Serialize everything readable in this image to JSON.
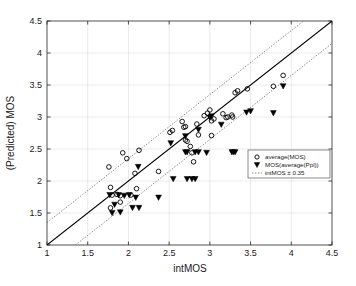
{
  "chart_data": {
    "type": "scatter",
    "title": "",
    "xlabel": "intMOS",
    "ylabel": "(Predicted) MOS",
    "xlim": [
      1,
      4.5
    ],
    "ylim": [
      1,
      4.5
    ],
    "xticks": [
      "1",
      "1.5",
      "2",
      "2.5",
      "3",
      "3.5",
      "4",
      "4.5"
    ],
    "xtick_values": [
      1,
      1.5,
      2,
      2.5,
      3,
      3.5,
      4,
      4.5
    ],
    "yticks": [
      "1",
      "1.5",
      "2",
      "2.5",
      "3",
      "3.5",
      "4",
      "4.5"
    ],
    "ytick_values": [
      1,
      1.5,
      2,
      2.5,
      3,
      3.5,
      4,
      4.5
    ],
    "grid": true,
    "legend_position": "lower-right",
    "reference_lines": [
      {
        "name": "identity",
        "style": "solid",
        "slope": 1,
        "intercept": 0
      },
      {
        "name": "upper-band",
        "style": "dotted",
        "slope": 1,
        "intercept": 0.35
      },
      {
        "name": "lower-band",
        "style": "dotted",
        "slope": 1,
        "intercept": -0.35
      }
    ],
    "series": [
      {
        "name": "average(MOS)",
        "marker": "circle-open",
        "points": [
          [
            1.76,
            2.22
          ],
          [
            1.78,
            1.9
          ],
          [
            1.78,
            1.58
          ],
          [
            1.8,
            1.78
          ],
          [
            1.86,
            1.79
          ],
          [
            1.9,
            1.77
          ],
          [
            1.93,
            2.44
          ],
          [
            1.98,
            2.35
          ],
          [
            1.9,
            1.67
          ],
          [
            2.03,
            1.78
          ],
          [
            2.08,
            2.12
          ],
          [
            2.1,
            1.88
          ],
          [
            2.13,
            2.48
          ],
          [
            2.37,
            2.15
          ],
          [
            2.51,
            2.76
          ],
          [
            2.54,
            2.79
          ],
          [
            2.66,
            2.93
          ],
          [
            2.68,
            2.84
          ],
          [
            2.7,
            2.85
          ],
          [
            2.7,
            2.64
          ],
          [
            2.72,
            2.62
          ],
          [
            2.76,
            2.54
          ],
          [
            2.78,
            2.44
          ],
          [
            2.8,
            2.3
          ],
          [
            2.84,
            2.89
          ],
          [
            2.86,
            2.72
          ],
          [
            2.93,
            3.02
          ],
          [
            2.97,
            3.06
          ],
          [
            3.0,
            3.11
          ],
          [
            3.02,
            2.94
          ],
          [
            3.02,
            2.71
          ],
          [
            3.05,
            2.97
          ],
          [
            3.16,
            3.05
          ],
          [
            3.2,
            2.99
          ],
          [
            3.22,
            3.0
          ],
          [
            3.27,
            3.03
          ],
          [
            3.28,
            3.0
          ],
          [
            3.31,
            3.38
          ],
          [
            3.34,
            3.41
          ],
          [
            3.46,
            3.44
          ],
          [
            3.78,
            3.48
          ],
          [
            3.9,
            3.65
          ]
        ]
      },
      {
        "name": "MOS(average(Ppl))",
        "marker": "triangle-down-filled",
        "points": [
          [
            1.77,
            1.78
          ],
          [
            1.8,
            1.5
          ],
          [
            1.83,
            1.63
          ],
          [
            1.88,
            1.78
          ],
          [
            1.9,
            1.51
          ],
          [
            1.95,
            1.77
          ],
          [
            2.01,
            1.78
          ],
          [
            2.05,
            1.58
          ],
          [
            2.09,
            1.74
          ],
          [
            2.12,
            2.22
          ],
          [
            2.13,
            1.58
          ],
          [
            2.37,
            1.74
          ],
          [
            2.52,
            2.59
          ],
          [
            2.55,
            2.03
          ],
          [
            2.7,
            2.7
          ],
          [
            2.7,
            2.45
          ],
          [
            2.72,
            2.45
          ],
          [
            2.72,
            2.03
          ],
          [
            2.78,
            2.03
          ],
          [
            2.82,
            2.03
          ],
          [
            2.82,
            2.45
          ],
          [
            2.86,
            2.8
          ],
          [
            2.86,
            2.45
          ],
          [
            2.96,
            2.44
          ],
          [
            3.0,
            2.99
          ],
          [
            3.02,
            3.01
          ],
          [
            3.14,
            2.88
          ],
          [
            3.27,
            2.45
          ],
          [
            3.29,
            2.45
          ],
          [
            3.31,
            2.45
          ],
          [
            3.45,
            3.07
          ],
          [
            3.5,
            3.09
          ],
          [
            3.78,
            3.06
          ],
          [
            3.9,
            3.48
          ]
        ]
      },
      {
        "name": "intMOS ± 0.35",
        "marker": "dotted-line",
        "points": []
      }
    ],
    "legend": [
      {
        "label": "average(MOS)",
        "marker": "circle-open"
      },
      {
        "label": "MOS(average(Ppl))",
        "marker": "triangle-down-filled"
      },
      {
        "label": "intMOS ± 0.35",
        "marker": "dotted-line"
      }
    ]
  },
  "colors": {
    "background": "#ffffff",
    "axis": "#262626",
    "grid": "#d4d4d4",
    "marker": "#000000",
    "band": "#555555"
  }
}
